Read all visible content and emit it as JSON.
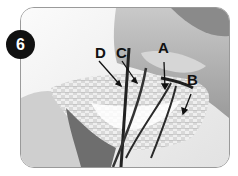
{
  "step": {
    "number": "6"
  },
  "labels": {
    "a": "A",
    "b": "B",
    "c": "C",
    "d": "D"
  },
  "colors": {
    "badge_bg": "#111111",
    "badge_text": "#ffffff",
    "frame_border": "#9a9a9a"
  }
}
